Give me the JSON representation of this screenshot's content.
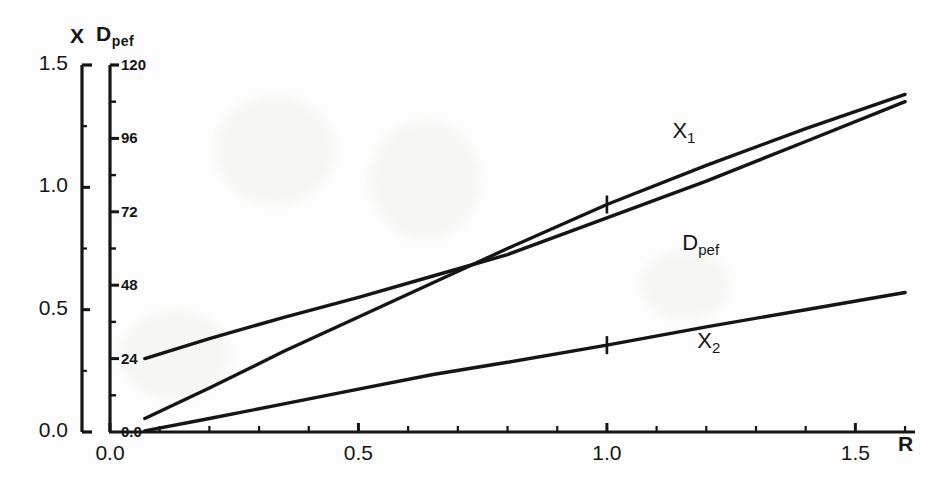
{
  "chart_data": {
    "type": "line",
    "title": "",
    "xlabel": "R",
    "ylabel": "X",
    "y2label": "D_pef",
    "xlim": [
      0.0,
      1.62
    ],
    "ylim": [
      0.0,
      1.5
    ],
    "y2lim": [
      0.0,
      120
    ],
    "grid": false,
    "legend": "inline-curve-labels",
    "x_ticks": [
      "0.0",
      "0.5",
      "1.0",
      "1.5"
    ],
    "x_tick_values": [
      0.0,
      0.5,
      1.0,
      1.5
    ],
    "y_ticks": [
      "0.0",
      "0.5",
      "1.0",
      "1.5"
    ],
    "y_tick_values": [
      0.0,
      0.5,
      1.0,
      1.5
    ],
    "y2_ticks": [
      "0.0",
      "24",
      "48",
      "72",
      "96",
      "120"
    ],
    "y2_tick_values": [
      0,
      24,
      48,
      72,
      96,
      120
    ],
    "y2_minor_tick_values": [
      12,
      36,
      60,
      84,
      108
    ],
    "series": [
      {
        "name": "X_1",
        "label": "X",
        "label_sub": "1",
        "axis": "left",
        "label_x": 1.16,
        "label_y": 1.22,
        "marker": "plus",
        "marker_points": [
          {
            "x": 1.0,
            "y": 0.93
          }
        ],
        "x": [
          0.07,
          0.2,
          0.35,
          0.5,
          0.65,
          0.8,
          1.0,
          1.2,
          1.4,
          1.6
        ],
        "y": [
          0.055,
          0.18,
          0.33,
          0.47,
          0.61,
          0.75,
          0.93,
          1.09,
          1.24,
          1.38
        ]
      },
      {
        "name": "D_pef",
        "label": "D",
        "label_sub": "pef",
        "axis": "right",
        "label_x": 1.18,
        "label_y": 0.76,
        "marker": "none",
        "marker_points": [],
        "x": [
          0.07,
          0.2,
          0.35,
          0.5,
          0.65,
          0.8,
          1.0,
          1.2,
          1.4,
          1.6
        ],
        "y": [
          24.0,
          30.5,
          37.5,
          44.0,
          51.0,
          58.0,
          70.0,
          82.0,
          95.0,
          108.0
        ]
      },
      {
        "name": "X_2",
        "label": "X",
        "label_sub": "2",
        "axis": "left",
        "label_x": 1.21,
        "label_y": 0.36,
        "marker": "plus",
        "marker_points": [
          {
            "x": 1.0,
            "y": 0.355
          }
        ],
        "x": [
          0.07,
          0.2,
          0.35,
          0.5,
          0.65,
          0.8,
          1.0,
          1.2,
          1.4,
          1.6
        ],
        "y": [
          0.005,
          0.055,
          0.115,
          0.175,
          0.235,
          0.285,
          0.355,
          0.43,
          0.5,
          0.57
        ]
      }
    ],
    "colors": {
      "ink": "#151515",
      "background": "#fdfdfd"
    }
  },
  "axes": {
    "left_title": "X",
    "right_title_main": "D",
    "right_title_sub": "pef",
    "x_title": "R"
  }
}
